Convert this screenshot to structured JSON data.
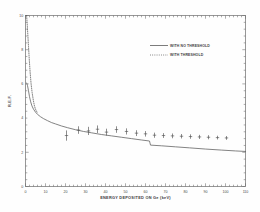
{
  "figure": {
    "name": "relative-efficiency-factor-plot",
    "background": "#fefefe",
    "frame_color": "#6b6b6b",
    "curve_color": "#5a5a5a",
    "marker_color": "#4f4f4f"
  },
  "chart_data": {
    "type": "line",
    "title": "",
    "xlabel": "ENERGY DEPOSITED ON Ge (keV)",
    "ylabel": "R.E.F.",
    "xlim": [
      0,
      110
    ],
    "ylim": [
      0,
      10
    ],
    "xticks": [
      0,
      10,
      20,
      30,
      40,
      50,
      60,
      70,
      80,
      90,
      100,
      110
    ],
    "yticks": [
      0,
      2,
      4,
      6,
      8,
      10
    ],
    "xminor_step": 2,
    "yminor_step": 0.4,
    "grid": false,
    "legend_position": "upper-right",
    "series": [
      {
        "name": "WITH NO THRESHOLD",
        "style": "solid",
        "x": [
          0.6,
          1.0,
          1.5,
          2.0,
          2.6,
          3.2,
          4.0,
          5.0,
          6.0,
          7.5,
          9.0,
          11.0,
          13.0,
          15.0,
          18.0,
          21.0,
          25.0,
          29.0,
          33.0,
          38.0,
          43.0,
          48.0,
          53.0,
          58.0,
          62.0,
          62.5,
          68.0,
          75.0,
          82.0,
          90.0,
          98.0,
          105.0,
          110.0
        ],
        "y": [
          6.05,
          5.9,
          5.6,
          5.25,
          4.95,
          4.72,
          4.52,
          4.35,
          4.22,
          4.08,
          3.97,
          3.85,
          3.74,
          3.66,
          3.54,
          3.44,
          3.32,
          3.22,
          3.14,
          3.04,
          2.96,
          2.88,
          2.8,
          2.72,
          2.66,
          2.42,
          2.38,
          2.32,
          2.26,
          2.19,
          2.13,
          2.08,
          2.05
        ]
      },
      {
        "name": "WITH THRESHOLD",
        "style": "dotted",
        "x": [
          0.55,
          0.8,
          1.1,
          1.5,
          1.9,
          2.3,
          2.8,
          3.3,
          3.9,
          4.4,
          4.9,
          5.4,
          5.8
        ],
        "y": [
          10.0,
          9.6,
          9.0,
          8.2,
          7.4,
          6.7,
          6.0,
          5.5,
          5.05,
          4.75,
          4.55,
          4.42,
          4.35
        ]
      }
    ],
    "data_points": {
      "name": "measured-points",
      "marker": "cross-with-error-bars",
      "x": [
        20.5,
        26.5,
        31.5,
        36.0,
        40.5,
        45.5,
        50.5,
        55.5,
        60.0,
        64.5,
        69.0,
        73.5,
        78.0,
        82.5,
        87.0,
        91.5,
        96.0,
        100.5
      ],
      "y": [
        2.98,
        3.3,
        3.25,
        3.35,
        3.18,
        3.33,
        3.22,
        3.12,
        3.08,
        3.0,
        2.98,
        2.96,
        2.94,
        2.92,
        2.9,
        2.88,
        2.86,
        2.84
      ],
      "yerr": [
        0.3,
        0.22,
        0.24,
        0.22,
        0.2,
        0.19,
        0.18,
        0.17,
        0.16,
        0.15,
        0.14,
        0.14,
        0.13,
        0.13,
        0.12,
        0.12,
        0.11,
        0.11
      ]
    }
  },
  "legend": {
    "entries": [
      {
        "label": "WITH NO THRESHOLD",
        "style": "solid"
      },
      {
        "label": "WITH THRESHOLD",
        "style": "dotted"
      }
    ]
  },
  "axis": {
    "x_title": "ENERGY DEPOSITED ON Ge (keV)",
    "y_title": "R.E.F.",
    "x_tick_labels": [
      "0",
      "10",
      "20",
      "30",
      "40",
      "50",
      "60",
      "70",
      "80",
      "90",
      "100",
      "110"
    ],
    "y_tick_labels": [
      "0",
      "2",
      "4",
      "6",
      "8",
      "10"
    ]
  }
}
